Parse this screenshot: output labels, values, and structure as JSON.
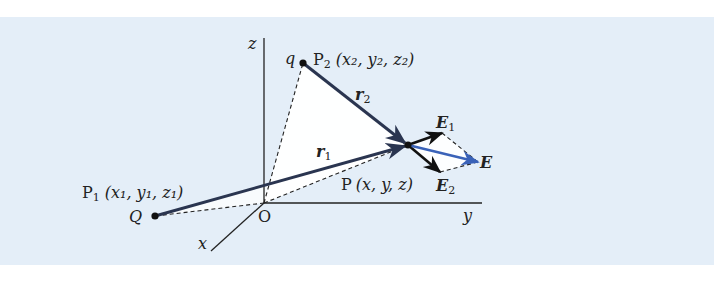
{
  "figure": {
    "background_color": "#e4eef8",
    "triangle_fill": "#ffffff",
    "vector_color": "#2a3550",
    "resultant_color": "#3a62b8",
    "axes": {
      "z_label": "z",
      "y_label": "y",
      "x_label": "x",
      "origin_label": "O"
    },
    "points": {
      "p1": {
        "charge": "Q",
        "name": "P",
        "sub": "1",
        "coords": "(x₁, y₁, z₁)"
      },
      "p2": {
        "charge": "q",
        "name": "P",
        "sub": "2",
        "coords": "(x₂, y₂, z₂)"
      },
      "p": {
        "name": "P",
        "coords": "(x, y, z)"
      }
    },
    "vectors": {
      "r1": {
        "name": "r",
        "sub": "1"
      },
      "r2": {
        "name": "r",
        "sub": "2"
      },
      "e1": {
        "name": "E",
        "sub": "1"
      },
      "e2": {
        "name": "E",
        "sub": "2"
      },
      "e": {
        "name": "E"
      }
    }
  }
}
